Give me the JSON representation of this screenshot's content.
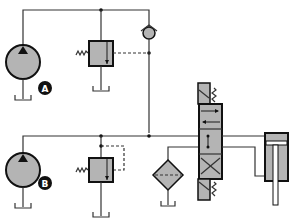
{
  "diagram": {
    "colors": {
      "fill": "#b4b4b4",
      "line": "#333333",
      "outline": "#111111",
      "background": "#ffffff"
    },
    "pumps": [
      {
        "id": "pump-a",
        "label": "A"
      },
      {
        "id": "pump-b",
        "label": "B"
      }
    ],
    "components": [
      "pump-a",
      "pump-b",
      "relief-valve-a",
      "relief-valve-b",
      "check-valve",
      "filter",
      "directional-control-valve",
      "hydraulic-cylinder",
      "tanks"
    ]
  }
}
